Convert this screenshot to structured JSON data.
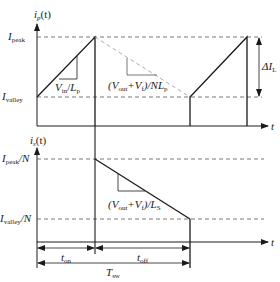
{
  "diagram": {
    "type": "flyback-current-waveforms",
    "top_plot": {
      "y_axis_label": {
        "base": "i",
        "sub": "p",
        "suffix": "(t)"
      },
      "x_axis_label": "t",
      "level_peak": {
        "base": "I",
        "sub": "peak"
      },
      "level_valley": {
        "base": "I",
        "sub": "valley"
      },
      "rise_slope": {
        "a": "V",
        "a_sub": "in",
        "sep": "/",
        "b": "L",
        "b_sub": "p"
      },
      "fall_slope": {
        "open": "(V",
        "a_sub": "out",
        "plus": "+V",
        "b_sub": "f",
        "close": ")/NL",
        "c_sub": "p"
      },
      "delta_label": {
        "base": "ΔI",
        "sub": "L"
      }
    },
    "bottom_plot": {
      "y_axis_label": {
        "base": "i",
        "sub": "s",
        "suffix": "(t)"
      },
      "x_axis_label": "t",
      "level_peak": {
        "base": "I",
        "sub": "peak",
        "suffix": "/N"
      },
      "level_valley": {
        "base": "I",
        "sub": "valley",
        "suffix": "/N"
      },
      "fall_slope": {
        "open": "(V",
        "a_sub": "out",
        "plus": "+V",
        "b_sub": "f",
        "close": ")/L",
        "c_sub": "S"
      }
    },
    "timing": {
      "t_on": {
        "base": "t",
        "sub": "on"
      },
      "t_off": {
        "base": "t",
        "sub": "off"
      },
      "t_sw": {
        "base": "T",
        "sub": "sw"
      }
    },
    "colors": {
      "line": "#1a1a1a",
      "dashed": "#555555",
      "dashed_light": "#999999"
    }
  }
}
